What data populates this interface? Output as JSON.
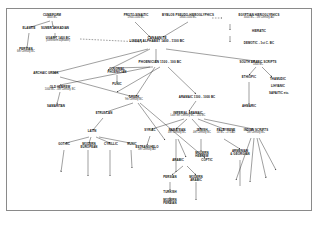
{
  "diagram": {
    "type": "tree",
    "frame_color": "#8a8a8a",
    "background": "#ffffff",
    "text_color": "#111111",
    "nodes": [
      {
        "id": "cuneiform",
        "label": "CUNEIFORM",
        "date": "3400 BC"
      },
      {
        "id": "elamite",
        "label": "ELAMITE",
        "date": ""
      },
      {
        "id": "sumer_akkadian",
        "label": "SUMER-AKKADIAN",
        "date": ""
      },
      {
        "id": "ugarit",
        "label": "UGARIT 1400 BC",
        "date": "(cuneiform alphabet)"
      },
      {
        "id": "persian_old",
        "label": "PERSIAN",
        "date": "6th Century BC"
      },
      {
        "id": "proto_sinaitic",
        "label": "PROTO-SINAITIC",
        "date": "1900-1500 BC"
      },
      {
        "id": "byblos",
        "label": "BYBLOS PSEUDO-HIEROGLYPHICS",
        "date": "1800-1500 BC"
      },
      {
        "id": "egyptian",
        "label": "EGYPTIAN HIEROGLYPHICS",
        "date": "3000 BC - 1st Century AD"
      },
      {
        "id": "hieratic",
        "label": "HIERATIC",
        "date": ""
      },
      {
        "id": "demotic",
        "label": "DEMOTIC - 1st C. BC",
        "date": ""
      },
      {
        "id": "canaanite",
        "label": "CANAANITE",
        "date": "LINEAR ALPHABET  1400 - 1100 BC"
      },
      {
        "id": "phoenician",
        "label": "PHOENICIAN 1100 - 100 BC",
        "date": ""
      },
      {
        "id": "south_arabic",
        "label": "SOUTH ARABIC SCRIPTS",
        "date": "1300 BC"
      },
      {
        "id": "ethiopic",
        "label": "ETHIOPIC",
        "date": ""
      },
      {
        "id": "thamudic",
        "label": "THAMUDIC",
        "date": ""
      },
      {
        "id": "lihyanic",
        "label": "LIHYANIC",
        "date": ""
      },
      {
        "id": "safaitic",
        "label": "SAFAITIC  etc.",
        "date": ""
      },
      {
        "id": "archaic_greek",
        "label": "ARCHAIC GREEK",
        "date": ""
      },
      {
        "id": "colonial_phoen",
        "label": "COLONIAL",
        "date": "PHOENICIAN"
      },
      {
        "id": "punic",
        "label": "PUNIC",
        "date": ""
      },
      {
        "id": "old_hebrew",
        "label": "OLD HEBREW",
        "date": "1000 BC - 4th Century BC"
      },
      {
        "id": "samaritan",
        "label": "SAMARITAN",
        "date": ""
      },
      {
        "id": "greek",
        "label": "GREEK",
        "date": "9th Century BC"
      },
      {
        "id": "aramaic",
        "label": "ARAMAIC 1100 - 1000 BC",
        "date": ""
      },
      {
        "id": "imperial_aramaic",
        "label": "IMPERIAL ARAMAIC",
        "date": "Late 8th Century BC - 200 BC"
      },
      {
        "id": "etruscan",
        "label": "ETRUSCAN",
        "date": ""
      },
      {
        "id": "ahmaric",
        "label": "AHMARIC",
        "date": ""
      },
      {
        "id": "latin",
        "label": "LATIN",
        "date": ""
      },
      {
        "id": "syriac",
        "label": "SYRIAC",
        "date": ""
      },
      {
        "id": "nabatean",
        "label": "NABATEAN",
        "date": "4th Century BC"
      },
      {
        "id": "jewish",
        "label": "JEWISH",
        "date": "4th Century BC"
      },
      {
        "id": "palmyrene",
        "label": "PALMYRENE",
        "date": "50 BC - 275 AD"
      },
      {
        "id": "indian_scripts",
        "label": "INDIAN SCRIPTS",
        "date": "5th Century BC"
      },
      {
        "id": "gothic",
        "label": "GOTHIC",
        "date": ""
      },
      {
        "id": "modern_european",
        "label": "MODERN",
        "date": "EUROPEAN"
      },
      {
        "id": "cyrillic",
        "label": "CYRILLIC",
        "date": ""
      },
      {
        "id": "runic",
        "label": "RUNIC",
        "date": ""
      },
      {
        "id": "estranghelo",
        "label": "ESTRANGHELO",
        "date": "5th Century AD"
      },
      {
        "id": "modern_hebrew",
        "label": "MODERN",
        "date": "HEBREW"
      },
      {
        "id": "armenian_georgian",
        "label": "ARMENIAN",
        "date": "& GEORGIAN"
      },
      {
        "id": "arabic",
        "label": "ARABIC",
        "date": ""
      },
      {
        "id": "coptic",
        "label": "COPTIC",
        "date": ""
      },
      {
        "id": "persian2",
        "label": "PERSIAN",
        "date": ""
      },
      {
        "id": "modern_arabic",
        "label": "MODERN",
        "date": "ARABIC"
      },
      {
        "id": "turkish",
        "label": "TURKISH",
        "date": ""
      },
      {
        "id": "modern_persian",
        "label": "MODERN",
        "date": "PERSIAN"
      }
    ]
  }
}
